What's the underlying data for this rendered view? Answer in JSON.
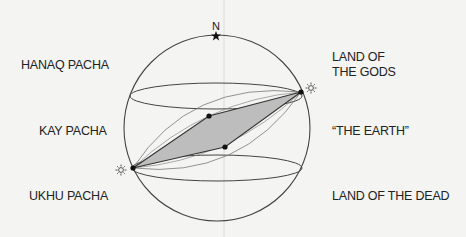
{
  "diagram": {
    "north_label": "N",
    "left_labels": {
      "upper": "HANAQ PACHA",
      "middle": "KAY PACHA",
      "lower": "UKHU PACHA"
    },
    "right_labels": {
      "upper_line1": "LAND OF",
      "upper_line2": "THE GODS",
      "middle": "“THE EARTH”",
      "lower": "LAND OF THE DEAD"
    },
    "colors": {
      "line": "#333333",
      "fill": "#bdbdbd",
      "background": "#f4f4f3"
    }
  }
}
